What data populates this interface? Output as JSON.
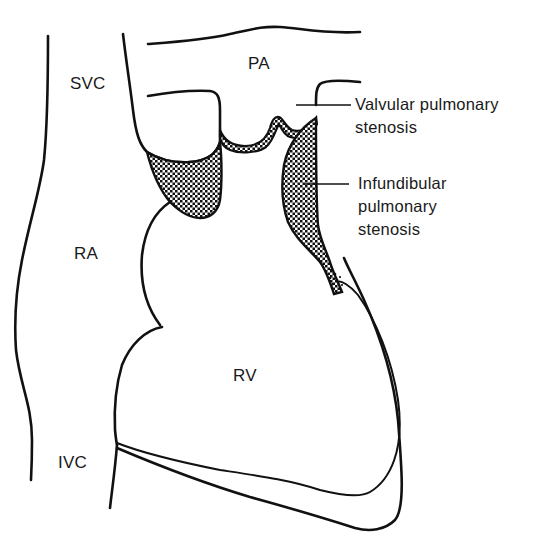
{
  "diagram": {
    "colors": {
      "line": "#111111",
      "background": "#ffffff",
      "hatch_dark": "#111111",
      "hatch_light": "#ffffff"
    },
    "chambers": {
      "svc": "SVC",
      "pa": "PA",
      "ra": "RA",
      "rv": "RV",
      "ivc": "IVC"
    },
    "annotations": {
      "valvular": {
        "line1": "Valvular pulmonary",
        "line2": "stenosis"
      },
      "infundibular": {
        "line1": "Infundibular",
        "line2": "pulmonary",
        "line3": "stenosis"
      }
    }
  }
}
